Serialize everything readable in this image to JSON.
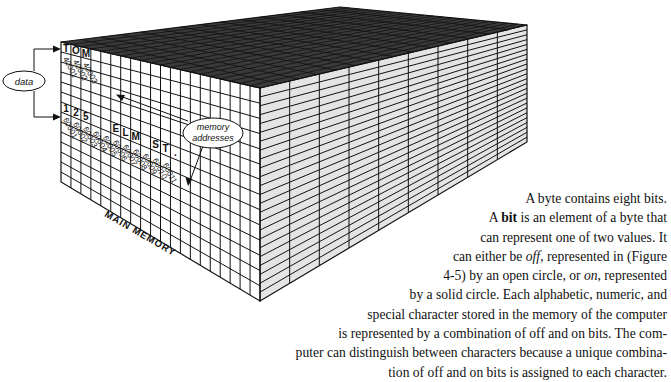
{
  "figure": {
    "title": "MAIN MEMORY",
    "callouts": {
      "data": "data",
      "memory_addresses_line1": "memory",
      "memory_addresses_line2": "addresses"
    },
    "row1": {
      "chars": [
        "T",
        "O",
        "M"
      ],
      "addresses": [
        "40001",
        "40002",
        "40003"
      ]
    },
    "row2": {
      "chars": [
        "1",
        "2",
        "5",
        "",
        "",
        "E",
        "L",
        "M",
        "",
        "S",
        "T",
        "."
      ],
      "addresses": [
        "60001",
        "60002",
        "60003",
        "60004",
        "60005",
        "60006",
        "60007",
        "60008",
        "60009",
        "60010",
        "60011"
      ]
    },
    "colors": {
      "top_face": "#3a3a3a",
      "front_face": "#ffffff",
      "side_face": "#e4e4e4",
      "grid_line": "#111111"
    }
  },
  "caption": {
    "lines": [
      "A byte contains eight bits.",
      "is an element of a byte that",
      "can represent one of two values. It",
      "can either be",
      "4-5) by an open circle, or",
      "by a solid circle. Each alphabetic, numeric, and",
      "special character stored in the memory of the computer",
      "is represented by a combination of off and on bits. The com-",
      "puter can distinguish between characters because a unique combina-",
      "tion of off and on bits is assigned to each character."
    ],
    "line2_prefix": "A ",
    "line2_bold": "bit",
    "line4_italic": "off",
    "line4_rest": ", represented in (Figure",
    "line5_italic": "on",
    "line5_rest": ", represented"
  }
}
